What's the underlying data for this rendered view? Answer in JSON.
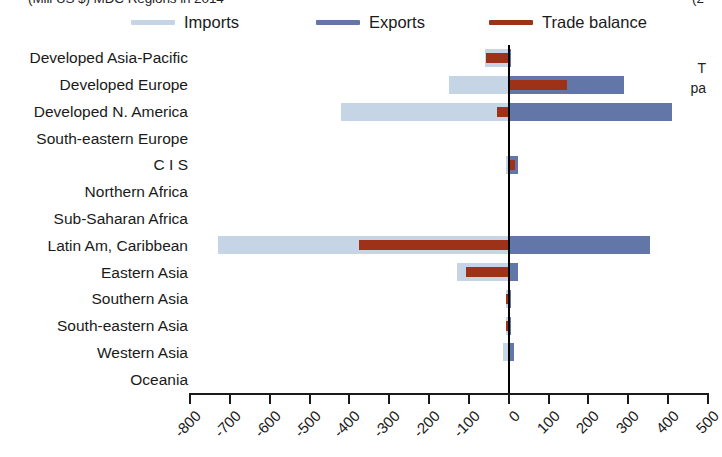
{
  "header": {
    "title_clipped": "(Mill US $) MDC Regions in 2014",
    "title_right_clipped": "(2",
    "side_note_line1": "T",
    "side_note_line2": "pa"
  },
  "legend": {
    "position": "top",
    "items": [
      {
        "label": "Imports",
        "color": "#c5d5e6",
        "name": "imports"
      },
      {
        "label": "Exports",
        "color": "#6277a8",
        "name": "exports"
      },
      {
        "label": "Trade balance",
        "color": "#9e3219",
        "name": "trade-balance"
      }
    ]
  },
  "chart_data": {
    "type": "bar",
    "orientation": "horizontal",
    "title": "(Mill US $) MDC Regions in 2014",
    "xlabel": "",
    "ylabel": "",
    "xlim": [
      -800,
      500
    ],
    "xticks": [
      -800,
      -700,
      -600,
      -500,
      -400,
      -300,
      -200,
      -100,
      0,
      100,
      200,
      300,
      400,
      500
    ],
    "xtick_labels": [
      "-800",
      "-700",
      "-600",
      "-500",
      "-400",
      "-300",
      "-200",
      "-100",
      "0",
      "100",
      "200",
      "300",
      "400",
      "500"
    ],
    "grid": false,
    "legend_position": "top",
    "categories": [
      "Developed Asia-Pacific",
      "Developed Europe",
      "Developed N. America",
      "South-eastern Europe",
      "C I S",
      "Northern Africa",
      "Sub-Saharan Africa",
      "Latin Am, Caribbean",
      "Eastern Asia",
      "Southern Asia",
      "South-eastern Asia",
      "Western Asia",
      "Oceania"
    ],
    "series": [
      {
        "name": "Imports",
        "color": "#c5d5e6",
        "note": "plotted as negative values extending left of zero",
        "values": [
          -60,
          -150,
          -420,
          0,
          -6,
          0,
          0,
          -730,
          -130,
          -8,
          -8,
          -14,
          0
        ]
      },
      {
        "name": "Exports",
        "color": "#6277a8",
        "note": "plotted as positive values extending right of zero",
        "values": [
          4,
          290,
          410,
          0,
          22,
          0,
          0,
          355,
          22,
          2,
          2,
          14,
          0
        ]
      },
      {
        "name": "Trade balance",
        "color": "#9e3219",
        "values": [
          -56,
          145,
          -30,
          0,
          16,
          0,
          0,
          -375,
          -108,
          -6,
          -6,
          0,
          0
        ]
      }
    ]
  }
}
